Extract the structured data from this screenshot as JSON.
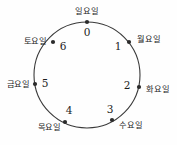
{
  "chart_data": {
    "type": "diagram",
    "title": "",
    "shape": "circle",
    "direction": "counterclockwise",
    "center": [
      87,
      75
    ],
    "radius": 53,
    "nodes": [
      {
        "index": "0",
        "label": "일요일",
        "angle_deg": 90,
        "dot": [
          87,
          22
        ],
        "index_pos": [
          87,
          33
        ],
        "index_anchor": "middle",
        "label_pos": [
          87,
          11
        ],
        "label_anchor": "middle"
      },
      {
        "index": "1",
        "label": "월요일",
        "angle_deg": 38,
        "dot": [
          129,
          42
        ],
        "index_pos": [
          118,
          47
        ],
        "index_anchor": "middle",
        "label_pos": [
          137,
          39
        ],
        "label_anchor": "start"
      },
      {
        "index": "2",
        "label": "화요일",
        "angle_deg": -13,
        "dot": [
          139,
          87
        ],
        "index_pos": [
          127,
          86
        ],
        "index_anchor": "middle",
        "label_pos": [
          146,
          89
        ],
        "label_anchor": "start"
      },
      {
        "index": "3",
        "label": "수요일",
        "angle_deg": -63,
        "dot": [
          112,
          120
        ],
        "index_pos": [
          110,
          110
        ],
        "index_anchor": "middle",
        "label_pos": [
          119,
          125
        ],
        "label_anchor": "start"
      },
      {
        "index": "4",
        "label": "목요일",
        "angle_deg": -115,
        "dot": [
          65,
          122
        ],
        "index_pos": [
          69,
          111
        ],
        "index_anchor": "middle",
        "label_pos": [
          61,
          127
        ],
        "label_anchor": "end"
      },
      {
        "index": "5",
        "label": "금요일",
        "angle_deg": 168,
        "dot": [
          35,
          84
        ],
        "index_pos": [
          45,
          84
        ],
        "index_anchor": "middle",
        "label_pos": [
          30,
          84
        ],
        "label_anchor": "end"
      },
      {
        "index": "6",
        "label": "토요일",
        "angle_deg": 128,
        "dot": [
          53,
          42
        ],
        "index_pos": [
          63,
          47
        ],
        "index_anchor": "middle",
        "label_pos": [
          47,
          41
        ],
        "label_anchor": "end"
      }
    ],
    "colors": {
      "background": "#fefefe",
      "stroke": "#3a3a3a",
      "text": "#1d1d1d",
      "dot": "#2b2b2b"
    }
  }
}
